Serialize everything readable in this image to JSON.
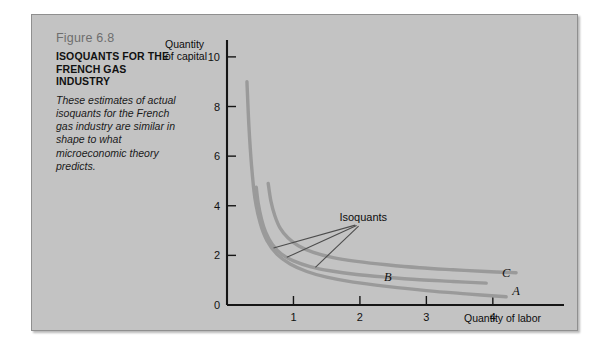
{
  "figure": {
    "number": "Figure 6.8",
    "title": "ISOQUANTS FOR THE FRENCH GAS INDUSTRY",
    "description": "These estimates of actual isoquants for the French gas industry are similar in shape to what microeconomic theory predicts."
  },
  "chart_data": {
    "type": "line",
    "title": "",
    "xlabel": "Quantity of labor",
    "ylabel": "Quantity of capital",
    "xlim": [
      0,
      4.8
    ],
    "ylim": [
      0,
      10.6
    ],
    "xticks": [
      "1",
      "2",
      "3",
      "4"
    ],
    "xtick_values": [
      1,
      2,
      3,
      4
    ],
    "yticks": [
      "0",
      "2",
      "4",
      "6",
      "8",
      "10"
    ],
    "ytick_values": [
      0,
      2,
      4,
      6,
      8,
      10
    ],
    "grid": false,
    "legend": "none",
    "annotations": [
      {
        "text": "Isoquants",
        "x": 2.05,
        "y": 3.4
      }
    ],
    "series": [
      {
        "name": "A",
        "label": "A",
        "label_x": 4.35,
        "label_y": 0.42,
        "color": "#9a9a9a",
        "points": [
          [
            0.3,
            9.0
          ],
          [
            0.33,
            7.2
          ],
          [
            0.37,
            5.6
          ],
          [
            0.42,
            4.3
          ],
          [
            0.5,
            3.3
          ],
          [
            0.6,
            2.6
          ],
          [
            0.75,
            2.05
          ],
          [
            0.95,
            1.65
          ],
          [
            1.2,
            1.35
          ],
          [
            1.5,
            1.12
          ],
          [
            1.9,
            0.92
          ],
          [
            2.4,
            0.75
          ],
          [
            3.0,
            0.58
          ],
          [
            3.6,
            0.45
          ],
          [
            4.2,
            0.33
          ]
        ]
      },
      {
        "name": "B",
        "label": "B",
        "label_x": 2.42,
        "label_y": 0.95,
        "color": "#9a9a9a",
        "points": [
          [
            0.44,
            4.75
          ],
          [
            0.47,
            4.1
          ],
          [
            0.52,
            3.45
          ],
          [
            0.58,
            2.95
          ],
          [
            0.68,
            2.45
          ],
          [
            0.82,
            2.05
          ],
          [
            1.0,
            1.78
          ],
          [
            1.25,
            1.55
          ],
          [
            1.55,
            1.38
          ],
          [
            1.95,
            1.23
          ],
          [
            2.4,
            1.12
          ],
          [
            2.9,
            1.02
          ],
          [
            3.4,
            0.95
          ],
          [
            3.9,
            0.88
          ]
        ]
      },
      {
        "name": "C",
        "label": "C",
        "label_x": 4.2,
        "label_y": 1.12,
        "color": "#9a9a9a",
        "points": [
          [
            0.62,
            4.9
          ],
          [
            0.66,
            4.2
          ],
          [
            0.72,
            3.6
          ],
          [
            0.8,
            3.1
          ],
          [
            0.92,
            2.7
          ],
          [
            1.08,
            2.38
          ],
          [
            1.3,
            2.12
          ],
          [
            1.58,
            1.92
          ],
          [
            1.95,
            1.76
          ],
          [
            2.4,
            1.62
          ],
          [
            2.9,
            1.5
          ],
          [
            3.4,
            1.42
          ],
          [
            3.9,
            1.35
          ],
          [
            4.35,
            1.3
          ]
        ]
      }
    ],
    "leader_lines": [
      {
        "from_x": 1.93,
        "from_y": 3.22,
        "to_x": 0.7,
        "to_y": 2.3
      },
      {
        "from_x": 1.95,
        "from_y": 3.2,
        "to_x": 0.9,
        "to_y": 1.92
      },
      {
        "from_x": 1.98,
        "from_y": 3.18,
        "to_x": 1.33,
        "to_y": 1.52
      }
    ]
  }
}
